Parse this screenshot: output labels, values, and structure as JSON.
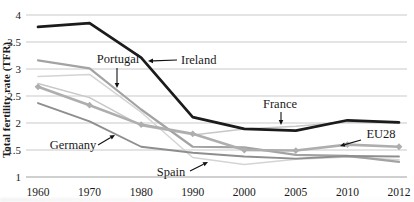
{
  "figure": {
    "background": "#ffffff"
  },
  "chart_data": {
    "type": "line",
    "title": "",
    "xlabel": "",
    "ylabel": "Total fertility rate (TFR)",
    "categories": [
      "1960",
      "1970",
      "1980",
      "1990",
      "2000",
      "2005",
      "2010",
      "2012"
    ],
    "ylim": [
      1,
      4
    ],
    "grid": true,
    "grid_values": [
      1.5,
      2,
      2.5,
      3,
      3.5,
      4
    ],
    "yticks": [
      {
        "value": 4,
        "label": "4"
      },
      {
        "value": 3.5,
        "label": "3.5"
      },
      {
        "value": 3,
        "label": "3"
      },
      {
        "value": 2.5,
        "label": "2.5"
      },
      {
        "value": 2,
        "label": "2"
      },
      {
        "value": 1.5,
        "label": "1.5"
      },
      {
        "value": 1,
        "label": "1"
      }
    ],
    "legend_position": "none (inline arrow annotations)",
    "colors": {
      "grid": "#c9c9c9",
      "axis": "#a0a0a0",
      "text": "#1a1a1a",
      "annotation": "#111111"
    },
    "series": [
      {
        "id": "spain",
        "name": "Spain",
        "color": "#d4d4d4",
        "width": 1.5,
        "marker": "none",
        "values": [
          2.86,
          2.9,
          2.2,
          1.36,
          1.23,
          1.33,
          1.37,
          1.32
        ]
      },
      {
        "id": "france",
        "name": "France",
        "color": "#c7c7c7",
        "width": 1.5,
        "marker": "none",
        "values": [
          2.73,
          2.47,
          1.95,
          1.78,
          1.89,
          1.94,
          2.02,
          2.0
        ]
      },
      {
        "id": "portugal",
        "name": "Portugal",
        "color": "#a3a3a3",
        "width": 2.2,
        "marker": "none",
        "values": [
          3.16,
          3.01,
          2.25,
          1.56,
          1.55,
          1.41,
          1.39,
          1.28
        ]
      },
      {
        "id": "germany",
        "name": "Germany",
        "color": "#8e8e8e",
        "width": 1.9,
        "marker": "none",
        "values": [
          2.37,
          2.03,
          1.56,
          1.45,
          1.38,
          1.34,
          1.39,
          1.38
        ]
      },
      {
        "id": "eu28",
        "name": "EU28",
        "color": "#aeaeae",
        "width": 2.6,
        "marker": "diamond",
        "values": [
          2.67,
          2.33,
          1.97,
          1.8,
          1.5,
          1.49,
          1.6,
          1.56
        ]
      },
      {
        "id": "ireland",
        "name": "Ireland",
        "color": "#1b1b1b",
        "width": 2.7,
        "marker": "none",
        "values": [
          3.78,
          3.85,
          3.21,
          2.11,
          1.89,
          1.86,
          2.05,
          2.01
        ]
      }
    ],
    "annotations": [
      {
        "id": "portugal",
        "label": "Portugal",
        "tx": 118,
        "ty": 63,
        "anchor": "middle",
        "x1": 117,
        "y1": 68,
        "x2": 117,
        "y2": 88
      },
      {
        "id": "ireland",
        "label": "Ireland",
        "tx": 181,
        "ty": 64,
        "anchor": "start",
        "x1": 177,
        "y1": 60,
        "x2": 148,
        "y2": 61
      },
      {
        "id": "france",
        "label": "France",
        "tx": 280,
        "ty": 108,
        "anchor": "middle",
        "x1": 281,
        "y1": 112,
        "x2": 281,
        "y2": 125
      },
      {
        "id": "germany",
        "label": "Germany",
        "tx": 73,
        "ty": 149,
        "anchor": "middle",
        "x1": 98,
        "y1": 145,
        "x2": 115,
        "y2": 135
      },
      {
        "id": "spain",
        "label": "Spain",
        "tx": 171,
        "ty": 176,
        "anchor": "middle",
        "x1": 190,
        "y1": 171,
        "x2": 208,
        "y2": 162
      },
      {
        "id": "eu28",
        "label": "EU28",
        "tx": 381,
        "ty": 138,
        "anchor": "middle",
        "x1": 361,
        "y1": 140,
        "x2": 340,
        "y2": 146
      }
    ],
    "layout": {
      "x_first": 38,
      "x_last": 399,
      "grid_x0": 26,
      "grid_x1": 407,
      "y_base": 177,
      "y_unit": 54,
      "xlabel_y": 196,
      "ytick_x": 21,
      "title_x": 10,
      "title_y": 100,
      "tick_font": 11,
      "xtick_font": 11.5,
      "annot_font": 12.5,
      "title_font": 11
    }
  }
}
